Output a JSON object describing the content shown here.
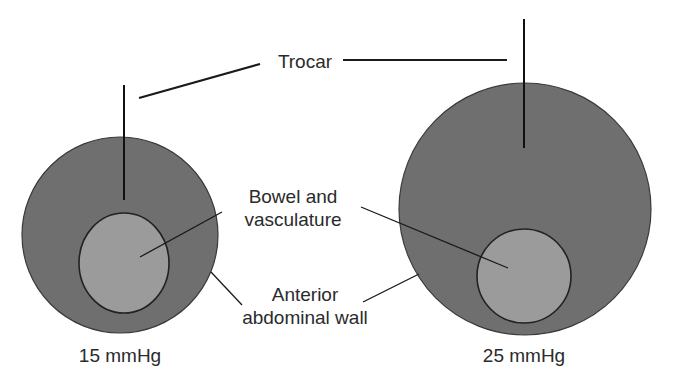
{
  "labels": {
    "trocar": "Trocar",
    "bowel_line1": "Bowel and",
    "bowel_line2": "vasculature",
    "wall_line1": "Anterior",
    "wall_line2": "abdominal wall",
    "left_pressure": "15 mmHg",
    "right_pressure": "25 mmHg"
  },
  "colors": {
    "abdominal_cavity": "#6f6f6f",
    "bowel": "#9b9b9b",
    "outline": "#2a2a2a",
    "text": "#2b2b2b"
  },
  "panels": [
    {
      "pressure": "15 mmHg",
      "outer": {
        "cx": 120,
        "cy": 235,
        "r": 98
      },
      "inner": {
        "cx": 133,
        "cy": 263,
        "rx": 45,
        "ry": 50
      },
      "trocar": {
        "x": 124,
        "y1": 85,
        "y2": 200
      }
    },
    {
      "pressure": "25 mmHg",
      "outer": {
        "cx": 525,
        "cy": 209,
        "r": 126
      },
      "inner": {
        "cx": 524,
        "cy": 276,
        "rx": 47,
        "ry": 47
      },
      "trocar": {
        "x": 524,
        "y1": 19,
        "y2": 148
      }
    }
  ]
}
